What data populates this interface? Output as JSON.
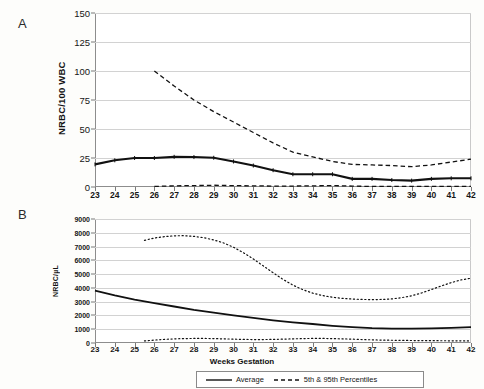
{
  "figure": {
    "panel_a_letter": "A",
    "panel_b_letter": "B",
    "xaxis_title": "Weeks Gestation"
  },
  "legend": {
    "entries": [
      {
        "label": "Average",
        "style": "solid",
        "icon": "solid-line-icon"
      },
      {
        "label": "5th & 95th Percentiles",
        "style": "dashed",
        "icon": "dashed-line-icon"
      }
    ]
  },
  "chart_data": [
    {
      "type": "line",
      "panel": "A",
      "title": "",
      "xlabel": "Weeks Gestation",
      "ylabel": "NRBC/100 WBC",
      "x": [
        23,
        24,
        25,
        26,
        27,
        28,
        29,
        30,
        31,
        32,
        33,
        34,
        35,
        36,
        37,
        38,
        39,
        40,
        41,
        42
      ],
      "xlim": [
        23,
        42
      ],
      "ylim": [
        0,
        150
      ],
      "yticks": [
        0,
        25,
        50,
        75,
        100,
        125,
        150
      ],
      "xticks": [
        23,
        24,
        25,
        26,
        27,
        28,
        29,
        30,
        31,
        32,
        33,
        34,
        35,
        36,
        37,
        38,
        39,
        40,
        41,
        42
      ],
      "grid": true,
      "legend_position": "bottom",
      "series": [
        {
          "name": "Average",
          "style": "solid",
          "values": [
            19.5,
            23.0,
            25.0,
            25.0,
            26.0,
            25.8,
            25.2,
            22.0,
            18.5,
            14.5,
            11.0,
            11.0,
            11.0,
            7.0,
            7.0,
            6.0,
            5.5,
            7.0,
            7.5,
            7.5
          ]
        },
        {
          "name": "95th Percentile",
          "style": "dashed",
          "x": [
            26,
            27,
            28,
            29,
            30,
            31,
            32,
            33,
            34,
            35,
            36,
            37,
            38,
            39,
            40,
            41,
            42
          ],
          "values": [
            100.0,
            87.0,
            75.0,
            65.0,
            56.0,
            47.0,
            38.0,
            30.0,
            26.0,
            22.0,
            19.5,
            19.0,
            18.5,
            17.5,
            19.0,
            21.5,
            24.0
          ]
        },
        {
          "name": "5th Percentile",
          "style": "dashed",
          "x": [
            26,
            27,
            28,
            29,
            30,
            31,
            32,
            33,
            34,
            35,
            36,
            37,
            38,
            39,
            40,
            41,
            42
          ],
          "values": [
            0.5,
            1.0,
            1.2,
            1.5,
            1.2,
            1.0,
            0.8,
            0.8,
            1.0,
            1.2,
            0.8,
            0.5,
            0.5,
            0.5,
            0.5,
            0.5,
            0.5
          ]
        }
      ]
    },
    {
      "type": "line",
      "panel": "B",
      "title": "",
      "xlabel": "Weeks Gestation",
      "ylabel": "NRBC/µL",
      "x": [
        23,
        24,
        25,
        26,
        27,
        28,
        29,
        30,
        31,
        32,
        33,
        34,
        35,
        36,
        37,
        38,
        39,
        40,
        41,
        42
      ],
      "xlim": [
        23,
        42
      ],
      "ylim": [
        0,
        9000
      ],
      "yticks": [
        0,
        1000,
        2000,
        3000,
        4000,
        5000,
        6000,
        7000,
        8000,
        9000
      ],
      "xticks": [
        23,
        24,
        25,
        26,
        27,
        28,
        29,
        30,
        31,
        32,
        33,
        34,
        35,
        36,
        37,
        38,
        39,
        40,
        41,
        42
      ],
      "grid": true,
      "legend_position": "bottom",
      "series": [
        {
          "name": "Average",
          "style": "solid",
          "values": [
            3800,
            3450,
            3150,
            2900,
            2650,
            2400,
            2200,
            2000,
            1820,
            1650,
            1500,
            1380,
            1250,
            1150,
            1080,
            1050,
            1040,
            1060,
            1100,
            1150
          ]
        },
        {
          "name": "95th Percentile",
          "style": "dotted",
          "x": [
            25.5,
            26,
            26.5,
            27,
            27.5,
            28,
            28.5,
            29,
            29.5,
            30,
            30.5,
            31,
            31.5,
            32,
            32.5,
            33,
            33.5,
            34,
            34.5,
            35,
            35.5,
            36,
            36.5,
            37,
            37.5,
            38,
            38.5,
            39,
            39.5,
            40,
            40.5,
            41,
            41.5,
            42
          ],
          "values": [
            7450,
            7620,
            7720,
            7780,
            7790,
            7740,
            7640,
            7480,
            7260,
            6950,
            6550,
            6100,
            5600,
            5100,
            4620,
            4200,
            3870,
            3620,
            3440,
            3320,
            3240,
            3190,
            3160,
            3150,
            3160,
            3200,
            3290,
            3430,
            3630,
            3880,
            4140,
            4380,
            4580,
            4700
          ]
        },
        {
          "name": "5th Percentile",
          "style": "dotted",
          "x": [
            25.5,
            26,
            26.5,
            27,
            27.5,
            28,
            28.5,
            29,
            29.5,
            30,
            30.5,
            31,
            31.5,
            32,
            32.5,
            33,
            33.5,
            34,
            34.5,
            35,
            35.5,
            36,
            36.5,
            37,
            37.5,
            38,
            38.5,
            39,
            39.5,
            40,
            40.5,
            41,
            41.5,
            42
          ],
          "values": [
            150,
            210,
            260,
            300,
            320,
            330,
            330,
            320,
            300,
            280,
            260,
            250,
            250,
            260,
            280,
            300,
            320,
            330,
            330,
            320,
            300,
            280,
            250,
            230,
            210,
            200,
            190,
            180,
            175,
            170,
            165,
            160,
            155,
            150
          ]
        }
      ]
    }
  ]
}
